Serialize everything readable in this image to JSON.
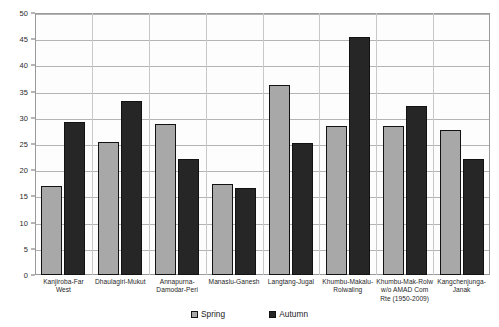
{
  "chart_data": {
    "type": "bar",
    "title": "",
    "xlabel": "",
    "ylabel": "",
    "ylim": [
      0,
      50
    ],
    "ytick_step": 5,
    "yticks": [
      0,
      5,
      10,
      15,
      20,
      25,
      30,
      35,
      40,
      45,
      50
    ],
    "grid": true,
    "legend_position": "bottom",
    "categories": [
      "Kanjiroba-Far West",
      "Dhaulagiri-Mukut",
      "Annapurna-Damodar-Peri",
      "Manaslu-Ganesh",
      "Langtang-Jugal",
      "Khumbu-Makalu-Rolwaling",
      "Khumbu-Mak-Rolw w/o AMAD Com Rte (1950-2009)",
      "Kangchenjunga-Janak"
    ],
    "category_lines": [
      [
        "Kanjiroba-Far West"
      ],
      [
        "Dhaulagiri-Mukut"
      ],
      [
        "Annapurna-",
        "Damodar-Peri"
      ],
      [
        "Manaslu-Ganesh"
      ],
      [
        "Langtang-Jugal"
      ],
      [
        "Khumbu-Makalu-",
        "Rolwaling"
      ],
      [
        "Khumbu-Mak-Rolw",
        "w/o AMAD Com",
        "Rte (1950-2009)"
      ],
      [
        "Kangchenjunga-",
        "Janak"
      ]
    ],
    "series": [
      {
        "name": "Spring",
        "color": "#a8a8a8",
        "values": [
          17.0,
          25.4,
          28.8,
          17.3,
          36.2,
          28.5,
          28.5,
          27.7
        ]
      },
      {
        "name": "Autumn",
        "color": "#262626",
        "values": [
          29.2,
          33.2,
          22.2,
          16.6,
          25.2,
          45.5,
          32.3,
          22.2
        ]
      }
    ]
  },
  "legend": {
    "items": [
      {
        "label": "Spring",
        "key": "spring"
      },
      {
        "label": "Autumn",
        "key": "autumn"
      }
    ]
  }
}
